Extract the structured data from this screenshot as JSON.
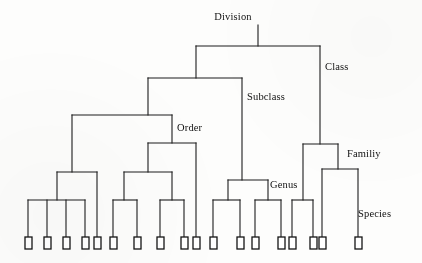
{
  "diagram": {
    "type": "tree",
    "ink_color": "#1c1c1c",
    "background_color": "#fdfdfc",
    "leaf_count": 18,
    "rank_labels": [
      {
        "id": "division",
        "text": "Division",
        "x": 233,
        "y": 20,
        "anchor": "middle"
      },
      {
        "id": "class",
        "text": "Class",
        "x": 325,
        "y": 70,
        "anchor": "start"
      },
      {
        "id": "subclass",
        "text": "Subclass",
        "x": 247,
        "y": 100,
        "anchor": "start"
      },
      {
        "id": "order",
        "text": "Order",
        "x": 177,
        "y": 131,
        "anchor": "start"
      },
      {
        "id": "familiy",
        "text": "Familiy",
        "x": 347,
        "y": 157,
        "anchor": "start"
      },
      {
        "id": "genus",
        "text": "Genus",
        "x": 270,
        "y": 188,
        "anchor": "start"
      },
      {
        "id": "species",
        "text": "Species",
        "x": 358,
        "y": 217,
        "anchor": "start"
      }
    ],
    "lines": [
      {
        "id": "division-stem",
        "x1": 258,
        "y1": 25,
        "x2": 258,
        "y2": 46
      },
      {
        "id": "division-bar",
        "x1": 196,
        "y1": 46,
        "x2": 320,
        "y2": 46
      },
      {
        "id": "division-left-drop",
        "x1": 196,
        "y1": 46,
        "x2": 196,
        "y2": 78
      },
      {
        "id": "class-drop",
        "x1": 320,
        "y1": 46,
        "x2": 320,
        "y2": 144
      },
      {
        "id": "subclass-bar",
        "x1": 148,
        "y1": 78,
        "x2": 242,
        "y2": 78
      },
      {
        "id": "subclass-left-drop",
        "x1": 148,
        "y1": 78,
        "x2": 148,
        "y2": 115
      },
      {
        "id": "subclass-right-drop",
        "x1": 242,
        "y1": 78,
        "x2": 242,
        "y2": 180
      },
      {
        "id": "order-bar",
        "x1": 72,
        "y1": 115,
        "x2": 172,
        "y2": 115
      },
      {
        "id": "order-left-drop",
        "x1": 72,
        "y1": 115,
        "x2": 72,
        "y2": 172
      },
      {
        "id": "order-right-drop",
        "x1": 172,
        "y1": 115,
        "x2": 172,
        "y2": 143
      },
      {
        "id": "order-sub-bar",
        "x1": 148,
        "y1": 143,
        "x2": 196,
        "y2": 143
      },
      {
        "id": "order-sub-left-drop",
        "x1": 148,
        "y1": 143,
        "x2": 148,
        "y2": 172
      },
      {
        "id": "order-sub-right-drop",
        "x1": 196,
        "y1": 143,
        "x2": 196,
        "y2": 237
      },
      {
        "id": "clusterA-bar",
        "x1": 57,
        "y1": 172,
        "x2": 97,
        "y2": 172
      },
      {
        "id": "clusterA-left-drop",
        "x1": 57,
        "y1": 172,
        "x2": 57,
        "y2": 200
      },
      {
        "id": "clusterA-right-drop",
        "x1": 97,
        "y1": 172,
        "x2": 97,
        "y2": 237
      },
      {
        "id": "clusterA-leaf-bar",
        "x1": 28,
        "y1": 200,
        "x2": 85,
        "y2": 200
      },
      {
        "id": "clusterB-bar",
        "x1": 124,
        "y1": 172,
        "x2": 172,
        "y2": 172
      },
      {
        "id": "clusterB-left-drop",
        "x1": 124,
        "y1": 172,
        "x2": 124,
        "y2": 200
      },
      {
        "id": "clusterB-right-drop",
        "x1": 172,
        "y1": 172,
        "x2": 172,
        "y2": 200
      },
      {
        "id": "clusterB-leaf-bar-1",
        "x1": 113,
        "y1": 200,
        "x2": 137,
        "y2": 200
      },
      {
        "id": "clusterB-leaf-bar-2",
        "x1": 160,
        "y1": 200,
        "x2": 184,
        "y2": 200
      },
      {
        "id": "genus-bar",
        "x1": 228,
        "y1": 180,
        "x2": 268,
        "y2": 180
      },
      {
        "id": "genus-left-drop",
        "x1": 228,
        "y1": 180,
        "x2": 228,
        "y2": 200
      },
      {
        "id": "genus-right-drop",
        "x1": 268,
        "y1": 180,
        "x2": 268,
        "y2": 200
      },
      {
        "id": "genus-leaf-bar-1",
        "x1": 213,
        "y1": 200,
        "x2": 240,
        "y2": 200
      },
      {
        "id": "genus-leaf-bar-2",
        "x1": 255,
        "y1": 200,
        "x2": 281,
        "y2": 200
      },
      {
        "id": "family-bar",
        "x1": 303,
        "y1": 144,
        "x2": 338,
        "y2": 144
      },
      {
        "id": "family-left-drop",
        "x1": 303,
        "y1": 144,
        "x2": 303,
        "y2": 200
      },
      {
        "id": "family-right-drop",
        "x1": 338,
        "y1": 144,
        "x2": 338,
        "y2": 169
      },
      {
        "id": "family-leaf-bar",
        "x1": 292,
        "y1": 200,
        "x2": 313,
        "y2": 200
      },
      {
        "id": "family-sub-bar",
        "x1": 322,
        "y1": 169,
        "x2": 358,
        "y2": 169
      },
      {
        "id": "family-sub-left-drop",
        "x1": 322,
        "y1": 169,
        "x2": 322,
        "y2": 237
      },
      {
        "id": "family-sub-right-drop",
        "x1": 358,
        "y1": 169,
        "x2": 358,
        "y2": 237
      }
    ],
    "leaf_stems": [
      {
        "id": "stem-1",
        "x": 28,
        "y1": 200,
        "y2": 237
      },
      {
        "id": "stem-2",
        "x": 47,
        "y1": 200,
        "y2": 237
      },
      {
        "id": "stem-3",
        "x": 66,
        "y1": 200,
        "y2": 237
      },
      {
        "id": "stem-4",
        "x": 85,
        "y1": 200,
        "y2": 237
      },
      {
        "id": "stem-5",
        "x": 113,
        "y1": 200,
        "y2": 237
      },
      {
        "id": "stem-6",
        "x": 137,
        "y1": 200,
        "y2": 237
      },
      {
        "id": "stem-7",
        "x": 160,
        "y1": 200,
        "y2": 237
      },
      {
        "id": "stem-8",
        "x": 184,
        "y1": 200,
        "y2": 237
      },
      {
        "id": "stem-9",
        "x": 213,
        "y1": 200,
        "y2": 237
      },
      {
        "id": "stem-10",
        "x": 240,
        "y1": 200,
        "y2": 237
      },
      {
        "id": "stem-11",
        "x": 255,
        "y1": 200,
        "y2": 237
      },
      {
        "id": "stem-12",
        "x": 281,
        "y1": 200,
        "y2": 237
      },
      {
        "id": "stem-13",
        "x": 292,
        "y1": 200,
        "y2": 237
      },
      {
        "id": "stem-14",
        "x": 313,
        "y1": 200,
        "y2": 237
      }
    ],
    "leaves": [
      {
        "id": "species-1",
        "x": 25,
        "y": 237,
        "w": 7,
        "h": 12
      },
      {
        "id": "species-2",
        "x": 44,
        "y": 237,
        "w": 7,
        "h": 12
      },
      {
        "id": "species-3",
        "x": 63,
        "y": 237,
        "w": 7,
        "h": 12
      },
      {
        "id": "species-4",
        "x": 82,
        "y": 237,
        "w": 7,
        "h": 12
      },
      {
        "id": "species-5",
        "x": 94,
        "y": 237,
        "w": 7,
        "h": 12
      },
      {
        "id": "species-6",
        "x": 110,
        "y": 237,
        "w": 7,
        "h": 12
      },
      {
        "id": "species-7",
        "x": 134,
        "y": 237,
        "w": 7,
        "h": 12
      },
      {
        "id": "species-8",
        "x": 157,
        "y": 237,
        "w": 7,
        "h": 12
      },
      {
        "id": "species-9",
        "x": 181,
        "y": 237,
        "w": 7,
        "h": 12
      },
      {
        "id": "species-10",
        "x": 193,
        "y": 237,
        "w": 7,
        "h": 12
      },
      {
        "id": "species-11",
        "x": 210,
        "y": 237,
        "w": 7,
        "h": 12
      },
      {
        "id": "species-12",
        "x": 237,
        "y": 237,
        "w": 7,
        "h": 12
      },
      {
        "id": "species-13",
        "x": 252,
        "y": 237,
        "w": 7,
        "h": 12
      },
      {
        "id": "species-14",
        "x": 278,
        "y": 237,
        "w": 7,
        "h": 12
      },
      {
        "id": "species-15",
        "x": 289,
        "y": 237,
        "w": 7,
        "h": 12
      },
      {
        "id": "species-16",
        "x": 310,
        "y": 237,
        "w": 7,
        "h": 12
      },
      {
        "id": "species-17",
        "x": 319,
        "y": 237,
        "w": 7,
        "h": 12
      },
      {
        "id": "species-18",
        "x": 355,
        "y": 237,
        "w": 7,
        "h": 12
      }
    ]
  }
}
